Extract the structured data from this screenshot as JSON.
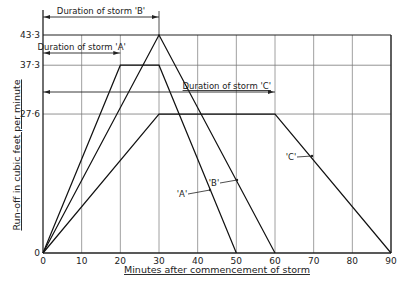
{
  "chart_data": {
    "type": "line",
    "title": "",
    "xlabel": "Minutes after commencement of storm",
    "ylabel": "Run-off in cubic feet per minute",
    "xlim": [
      0,
      90
    ],
    "ylim": [
      0,
      43.3
    ],
    "x_ticks": [
      0,
      10,
      20,
      30,
      40,
      50,
      60,
      70,
      80,
      90
    ],
    "x_tick_labels": [
      "0",
      "10",
      "20",
      "30",
      "40",
      "50",
      "60",
      "70",
      "80",
      "90"
    ],
    "y_ticks": [
      0,
      27.6,
      37.3,
      43.3
    ],
    "y_tick_labels": [
      "0",
      "27·6",
      "37·3",
      "43·3"
    ],
    "grid": true,
    "series": [
      {
        "name": "'A'",
        "x": [
          0,
          20,
          30,
          50
        ],
        "y": [
          0,
          37.3,
          37.3,
          0
        ]
      },
      {
        "name": "'B'",
        "x": [
          0,
          30,
          60
        ],
        "y": [
          0,
          43.3,
          0
        ]
      },
      {
        "name": "'C'",
        "x": [
          0,
          30,
          60,
          90
        ],
        "y": [
          0,
          27.6,
          27.6,
          0
        ]
      }
    ],
    "annotations": [
      {
        "text": "Duration of storm 'B'",
        "from_x": 0,
        "to_x": 30
      },
      {
        "text": "Duration of storm 'A'",
        "from_x": 0,
        "to_x": 20
      },
      {
        "text": "Duration of storm 'C'",
        "from_x": 0,
        "to_x": 60
      }
    ],
    "line_labels": [
      {
        "text": "'A'",
        "points_to": "A"
      },
      {
        "text": "'B'",
        "points_to": "B"
      },
      {
        "text": "'C'",
        "points_to": "C"
      }
    ]
  }
}
